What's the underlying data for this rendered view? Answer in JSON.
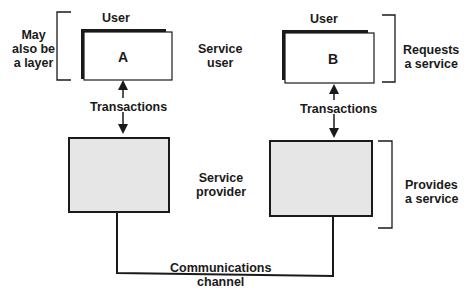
{
  "user_a": {
    "heading": "User",
    "letter": "A"
  },
  "user_b": {
    "heading": "User",
    "letter": "B"
  },
  "left_note": [
    "May",
    "also be",
    "a layer"
  ],
  "service_user": [
    "Service",
    "user"
  ],
  "service_provider": [
    "Service",
    "provider"
  ],
  "requests": [
    "Requests",
    "a service"
  ],
  "provides": [
    "Provides",
    "a service"
  ],
  "transactions_a": "Transactions",
  "transactions_b": "Transactions",
  "channel": [
    "Communications",
    "channel"
  ],
  "colors": {
    "line": "#1a1a1a",
    "provider_fill": "#e6e6e6",
    "user_fill": "#ffffff"
  }
}
